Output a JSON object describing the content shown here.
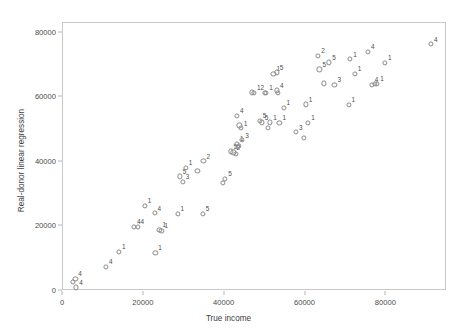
{
  "chart_data": {
    "type": "scatter",
    "title": "",
    "xlabel": "True income",
    "ylabel": "Real-donor linear regression",
    "xlim": [
      0,
      95000
    ],
    "ylim": [
      0,
      83000
    ],
    "xticks": [
      0,
      20000,
      40000,
      60000,
      80000
    ],
    "yticks": [
      0,
      20000,
      40000,
      60000,
      80000
    ],
    "xtick_labels": [
      "0",
      "20000",
      "40000",
      "60000",
      "80000"
    ],
    "ytick_labels": [
      "0",
      "20000",
      "40000",
      "60000",
      "80000"
    ],
    "grid": false,
    "legend": false,
    "marker": "open-circle",
    "point_label_note": "each point carries a small group-id label (1-5) drawn above-right of the marker",
    "points": [
      {
        "x": 2600,
        "y": 2600,
        "label": ""
      },
      {
        "x": 3300,
        "y": 3400,
        "label": "4"
      },
      {
        "x": 3500,
        "y": 800,
        "label": "4"
      },
      {
        "x": 10900,
        "y": 7100,
        "label": "4"
      },
      {
        "x": 14100,
        "y": 11800,
        "label": "1"
      },
      {
        "x": 17800,
        "y": 19600,
        "label": "4"
      },
      {
        "x": 18700,
        "y": 19500,
        "label": "4"
      },
      {
        "x": 20500,
        "y": 26100,
        "label": "1"
      },
      {
        "x": 22900,
        "y": 23800,
        "label": "4"
      },
      {
        "x": 23100,
        "y": 11500,
        "label": "1"
      },
      {
        "x": 24100,
        "y": 18600,
        "label": "1"
      },
      {
        "x": 24600,
        "y": 18400,
        "label": "1"
      },
      {
        "x": 28600,
        "y": 23600,
        "label": "1"
      },
      {
        "x": 29100,
        "y": 35200,
        "label": "5"
      },
      {
        "x": 29900,
        "y": 33600,
        "label": "3"
      },
      {
        "x": 30600,
        "y": 37800,
        "label": "1"
      },
      {
        "x": 33500,
        "y": 37000,
        "label": ""
      },
      {
        "x": 34800,
        "y": 23600,
        "label": "5"
      },
      {
        "x": 35000,
        "y": 39900,
        "label": "2"
      },
      {
        "x": 39900,
        "y": 33100,
        "label": ""
      },
      {
        "x": 40400,
        "y": 34400,
        "label": "5"
      },
      {
        "x": 41700,
        "y": 42900,
        "label": "5"
      },
      {
        "x": 42400,
        "y": 42600,
        "label": "2"
      },
      {
        "x": 43100,
        "y": 42200,
        "label": ""
      },
      {
        "x": 43300,
        "y": 45300,
        "label": "1"
      },
      {
        "x": 43600,
        "y": 44300,
        "label": ""
      },
      {
        "x": 43800,
        "y": 44600,
        "label": ""
      },
      {
        "x": 43300,
        "y": 53900,
        "label": "4"
      },
      {
        "x": 43900,
        "y": 51000,
        "label": ""
      },
      {
        "x": 44200,
        "y": 50100,
        "label": "1"
      },
      {
        "x": 44600,
        "y": 46400,
        "label": "3"
      },
      {
        "x": 46900,
        "y": 61200,
        "label": ""
      },
      {
        "x": 47500,
        "y": 61000,
        "label": "12"
      },
      {
        "x": 48900,
        "y": 52400,
        "label": "5"
      },
      {
        "x": 49400,
        "y": 51900,
        "label": "5"
      },
      {
        "x": 50200,
        "y": 61100,
        "label": ""
      },
      {
        "x": 50500,
        "y": 61000,
        "label": "1"
      },
      {
        "x": 51000,
        "y": 50300,
        "label": ""
      },
      {
        "x": 51500,
        "y": 51900,
        "label": "1"
      },
      {
        "x": 52300,
        "y": 66900,
        "label": "1"
      },
      {
        "x": 53100,
        "y": 67400,
        "label": "5"
      },
      {
        "x": 53200,
        "y": 61800,
        "label": "4"
      },
      {
        "x": 53400,
        "y": 61100,
        "label": ""
      },
      {
        "x": 53800,
        "y": 51800,
        "label": "1"
      },
      {
        "x": 54800,
        "y": 56500,
        "label": "1"
      },
      {
        "x": 57900,
        "y": 48900,
        "label": "3"
      },
      {
        "x": 59900,
        "y": 47100,
        "label": ""
      },
      {
        "x": 60300,
        "y": 57500,
        "label": "1"
      },
      {
        "x": 60900,
        "y": 51800,
        "label": "1"
      },
      {
        "x": 63400,
        "y": 72600,
        "label": "2"
      },
      {
        "x": 63700,
        "y": 68300,
        "label": "5"
      },
      {
        "x": 64800,
        "y": 64000,
        "label": ""
      },
      {
        "x": 66100,
        "y": 70500,
        "label": "5"
      },
      {
        "x": 67400,
        "y": 63600,
        "label": "3"
      },
      {
        "x": 70900,
        "y": 57400,
        "label": "1"
      },
      {
        "x": 71300,
        "y": 71500,
        "label": "1"
      },
      {
        "x": 72400,
        "y": 66900,
        "label": "1"
      },
      {
        "x": 75700,
        "y": 73700,
        "label": "4"
      },
      {
        "x": 76600,
        "y": 63500,
        "label": "4"
      },
      {
        "x": 77500,
        "y": 63800,
        "label": ""
      },
      {
        "x": 78000,
        "y": 63900,
        "label": "1"
      },
      {
        "x": 79900,
        "y": 70300,
        "label": "1"
      },
      {
        "x": 91300,
        "y": 76100,
        "label": "4"
      }
    ]
  }
}
